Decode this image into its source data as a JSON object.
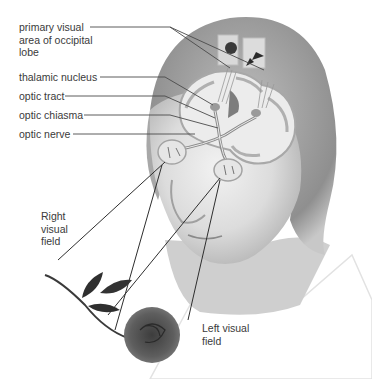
{
  "diagram": {
    "labels": {
      "primary_visual_area": "primary visual\narea of occipital\nlobe",
      "thalamic_nucleus": "thalamic nucleus",
      "optic_tract": "optic tract",
      "optic_chiasma": "optic chiasma",
      "optic_nerve": "optic nerve",
      "right_visual_field": "Right\nvisual\nfield",
      "left_visual_field": "Left visual\nfield"
    },
    "colors": {
      "background": "#ffffff",
      "text": "#3a3a3a",
      "leader_line": "#4a4a4a",
      "sight_line": "#2e2e2e",
      "skin_light": "#e8e8e8",
      "skin_mid": "#c9c9c9",
      "hair": "#9a9a9a",
      "brain_gray": "#b8b8b8",
      "rose": "#555555"
    }
  }
}
